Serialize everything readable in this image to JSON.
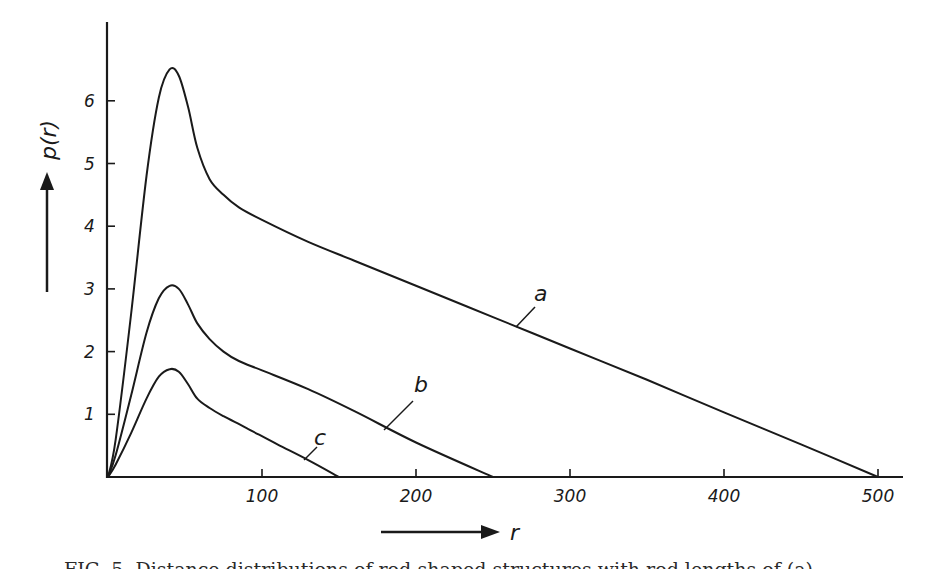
{
  "chart_data": {
    "type": "line",
    "title": "",
    "xlabel": "r",
    "ylabel": "p(r)",
    "xlim": [
      0,
      520
    ],
    "ylim": [
      0,
      7
    ],
    "x_ticks": [
      100,
      200,
      300,
      400,
      500
    ],
    "y_ticks": [
      1,
      2,
      3,
      4,
      5,
      6
    ],
    "grid": false,
    "legend": "inline labels on curves",
    "series": [
      {
        "name": "a",
        "x": [
          0,
          5,
          15,
          25,
          33,
          40,
          46,
          52,
          58,
          66,
          75,
          85,
          100,
          130,
          160,
          200,
          250,
          300,
          350,
          400,
          450,
          500
        ],
        "y": [
          0,
          0.6,
          2.6,
          4.8,
          6.05,
          6.5,
          6.4,
          5.9,
          5.25,
          4.75,
          4.5,
          4.3,
          4.1,
          3.75,
          3.45,
          3.05,
          2.55,
          2.05,
          1.55,
          1.03,
          0.52,
          0
        ]
      },
      {
        "name": "b",
        "x": [
          0,
          5,
          15,
          25,
          33,
          40,
          46,
          52,
          58,
          66,
          75,
          85,
          100,
          130,
          160,
          200,
          250
        ],
        "y": [
          0,
          0.35,
          1.3,
          2.3,
          2.85,
          3.05,
          3.0,
          2.75,
          2.45,
          2.2,
          2.0,
          1.85,
          1.7,
          1.4,
          1.05,
          0.55,
          0
        ]
      },
      {
        "name": "c",
        "x": [
          0,
          5,
          15,
          25,
          33,
          40,
          46,
          52,
          58,
          66,
          75,
          90,
          110,
          130,
          150
        ],
        "y": [
          0,
          0.2,
          0.7,
          1.25,
          1.6,
          1.72,
          1.68,
          1.48,
          1.25,
          1.1,
          0.97,
          0.78,
          0.52,
          0.27,
          0
        ]
      }
    ],
    "annotations": [
      {
        "text": "a",
        "at_r": 265
      },
      {
        "text": "b",
        "at_r": 180
      },
      {
        "text": "c",
        "at_r": 127
      }
    ]
  },
  "axes": {
    "y_label": "p(r)",
    "x_label": "r",
    "y_tick_labels": [
      "1",
      "2",
      "3",
      "4",
      "5",
      "6"
    ],
    "x_tick_labels": [
      "100",
      "200",
      "300",
      "400",
      "500"
    ]
  },
  "curve_labels": {
    "a": "a",
    "b": "b",
    "c": "c"
  },
  "caption": "FIG. 5. Distance distributions of rod-shaped structures with rod lengths of (a)"
}
